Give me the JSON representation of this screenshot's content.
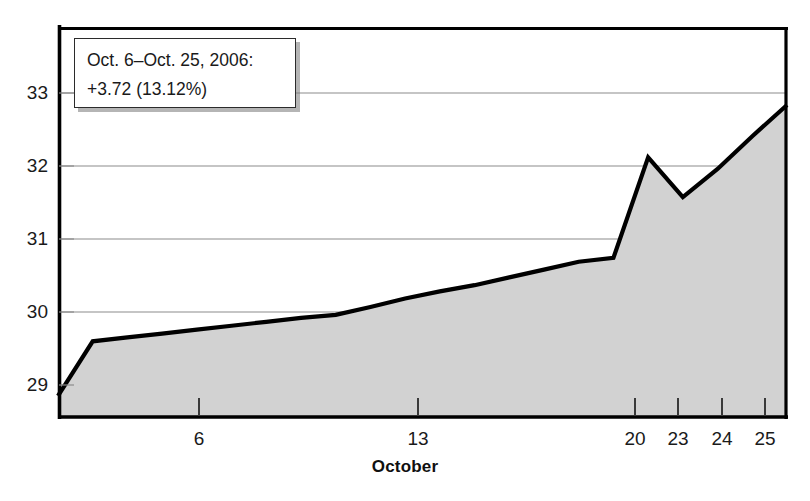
{
  "chart_data": {
    "type": "area",
    "title": "",
    "subtitle": "",
    "xlabel": "October",
    "ylabel": "",
    "grid": true,
    "legend": false,
    "xlim": [
      5,
      26
    ],
    "ylim": [
      28.45,
      33.45
    ],
    "y_ticks": [
      29,
      30,
      31,
      32,
      33
    ],
    "y_tick_labels": [
      "29",
      "30",
      "31",
      "32",
      "33"
    ],
    "x_ticks": [
      6,
      13,
      20,
      23,
      24,
      25
    ],
    "x_tick_labels": [
      "6",
      "13",
      "20",
      "23",
      "24",
      "25"
    ],
    "x": [
      5,
      6,
      7,
      8,
      9,
      10,
      11,
      12,
      13,
      14,
      15,
      16,
      17,
      18,
      19,
      20,
      21,
      22,
      23,
      24,
      25,
      26
    ],
    "values": [
      28.72,
      29.42,
      29.47,
      29.52,
      29.57,
      29.62,
      29.67,
      29.72,
      29.76,
      29.86,
      29.97,
      30.06,
      30.14,
      30.24,
      30.34,
      30.44,
      30.49,
      31.78,
      31.27,
      31.63,
      32.05,
      32.45
    ],
    "series": [
      {
        "name": "Price",
        "values": [
          28.72,
          29.42,
          29.47,
          29.52,
          29.57,
          29.62,
          29.67,
          29.72,
          29.76,
          29.86,
          29.97,
          30.06,
          30.14,
          30.24,
          30.34,
          30.44,
          30.49,
          31.78,
          31.27,
          31.63,
          32.05,
          32.45
        ]
      }
    ],
    "start_value": 28.72,
    "peak_value": 31.78,
    "trough_value": 31.27,
    "end_value": 32.45,
    "line_color": "#000000",
    "fill_color": "#d2d2d2",
    "grid_color": "#8c8c8c",
    "axis_color": "#000000"
  },
  "annotation": {
    "name": "performance-callout",
    "line1": "Oct. 6–Oct. 25, 2006:",
    "line2": "+3.72 (13.12%)",
    "change_absolute": "+3.72",
    "change_percent": "13.12%",
    "period_start": "Oct. 6",
    "period_end": "Oct. 25",
    "year": "2006"
  },
  "axis": {
    "x_title": "October",
    "y_tick_labels": [
      "33",
      "32",
      "31",
      "30",
      "29"
    ],
    "x_tick_labels": [
      "6",
      "13",
      "20",
      "23",
      "24",
      "25"
    ]
  }
}
